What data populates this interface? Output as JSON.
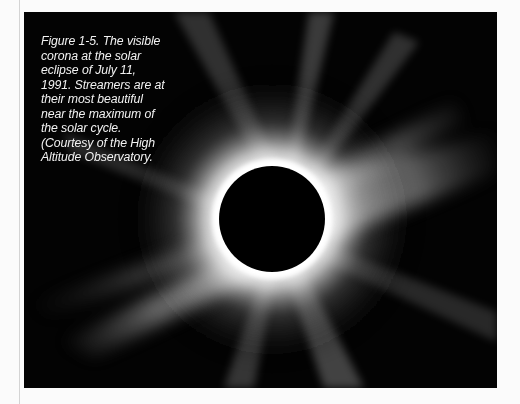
{
  "figure": {
    "caption_lines": [
      "Figure 1-5. The visible",
      "corona at the solar",
      "eclipse of July 11,",
      "1991. Streamers are at",
      "their most beautiful",
      "near the maximum of",
      "the solar cycle.",
      "(Courtesy of the High",
      "Altitude Observatory."
    ],
    "colors": {
      "background": "#fbfbfb",
      "sky": "#030303",
      "corona": "#ffffff",
      "moon_disk": "#000000"
    }
  }
}
